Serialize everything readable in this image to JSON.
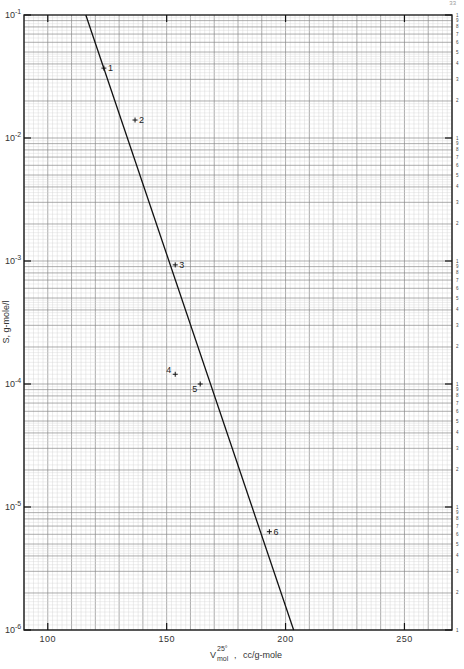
{
  "page": {
    "number": "33"
  },
  "chart_data": {
    "type": "scatter",
    "title": "",
    "xlabel": "V_mol^25°, cc/g-mole",
    "xlabel_parts": {
      "base": "V",
      "sup": "25°",
      "sub": "mol",
      "units": "cc/g-mole"
    },
    "ylabel": "S, g-mole/l",
    "yscale": "log",
    "xlim": [
      90,
      270
    ],
    "ylim": [
      1e-06,
      0.1
    ],
    "grid": true,
    "x_ticks": [
      100,
      150,
      200,
      250
    ],
    "x_tick_labels": [
      "100",
      "150",
      "200",
      "250"
    ],
    "y_ticks": [
      0.1,
      0.01,
      0.001,
      0.0001,
      1e-05,
      1e-06
    ],
    "y_tick_labels": [
      "10⁻¹",
      "10⁻²",
      "10⁻³",
      "10⁻⁴",
      "10⁻⁵",
      "10⁻⁶"
    ],
    "y_tick_exponents": [
      "-1",
      "-2",
      "-3",
      "-4",
      "-5",
      "-6"
    ],
    "right_minor_labels": [
      "1",
      "9",
      "8",
      "7",
      "6",
      "5",
      "4",
      "3",
      "2"
    ],
    "points": [
      {
        "label": "1",
        "x": 123.6,
        "y": 0.037
      },
      {
        "label": "2",
        "x": 136.7,
        "y": 0.014
      },
      {
        "label": "3",
        "x": 153.6,
        "y": 0.00093
      },
      {
        "label": "4",
        "x": 153.6,
        "y": 0.00012
      },
      {
        "label": "5",
        "x": 164.1,
        "y": 0.0001
      },
      {
        "label": "6",
        "x": 193.2,
        "y": 6.3e-06
      }
    ],
    "fit_line": {
      "x": [
        116,
        203.4
      ],
      "y": [
        0.1,
        1e-06
      ]
    }
  }
}
